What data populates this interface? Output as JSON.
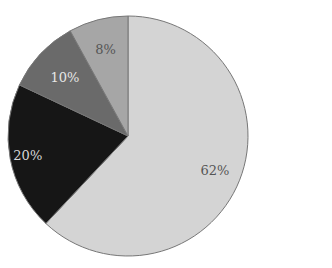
{
  "chart_data": {
    "type": "pie",
    "title": "",
    "start_angle": "12 o'clock",
    "direction": "clockwise",
    "slices": [
      {
        "label": "62%",
        "value": 62,
        "color": "#d4d4d4",
        "label_color": "#555555"
      },
      {
        "label": "20%",
        "value": 20,
        "color": "#161616",
        "label_color": "#d8d8d8"
      },
      {
        "label": "10%",
        "value": 10,
        "color": "#6a6a6a",
        "label_color": "#e6e6e6"
      },
      {
        "label": "8%",
        "value": 8,
        "color": "#a6a6a6",
        "label_color": "#555555"
      }
    ],
    "legend": null
  },
  "geometry": {
    "cx": 128,
    "cy": 136,
    "r": 120,
    "outline": "#777777"
  }
}
